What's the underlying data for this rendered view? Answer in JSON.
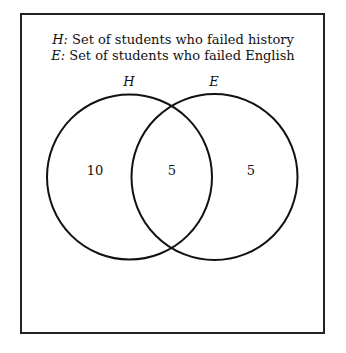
{
  "legend": [
    {
      "symbol": "H:",
      "text": " Set of students who failed history"
    },
    {
      "symbol": "E:",
      "text": " Set of students who failed English"
    }
  ],
  "sets": [
    {
      "name": "H",
      "cx": 129.5,
      "cy": 177,
      "r": 83
    },
    {
      "name": "E",
      "cx": 214.5,
      "cy": 177,
      "r": 83
    }
  ],
  "regions": {
    "h_only": "10",
    "both": "5",
    "e_only": "5"
  },
  "colors": {
    "stroke": "#111111",
    "background": "#ffffff"
  }
}
